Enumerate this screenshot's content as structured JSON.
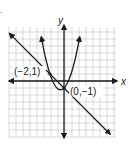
{
  "figure": {
    "type": "coordinate-graph",
    "axes": {
      "x_label": "x",
      "y_label": "y"
    },
    "grid": {
      "x_min": -8,
      "x_max": 7,
      "y_min": -8,
      "y_max": 8,
      "on": true
    },
    "curves": [
      {
        "name": "parabola",
        "equation": "y = x^2 + x - 1",
        "color": "#1a1a1a"
      },
      {
        "name": "line",
        "equation": "y = -x - 1",
        "color": "#1a1a1a"
      }
    ],
    "points": [
      {
        "label": "(−2,1)",
        "x": -2,
        "y": 1
      },
      {
        "label": "(0,−1)",
        "x": 0,
        "y": -1
      }
    ],
    "marker": "."
  },
  "chart_data": {
    "type": "line",
    "title": "",
    "xlabel": "x",
    "ylabel": "y",
    "grid": true,
    "series": [
      {
        "name": "y = x^2 + x - 1",
        "x": [
          -3,
          -2,
          -1,
          -0.5,
          0,
          1,
          2
        ],
        "values": [
          5,
          1,
          -1,
          -1.25,
          -1,
          1,
          5
        ]
      },
      {
        "name": "y = -x - 1",
        "x": [
          -8,
          -2,
          0,
          7
        ],
        "values": [
          7,
          1,
          -1,
          -8
        ]
      }
    ],
    "annotations": [
      "(−2,1)",
      "(0,−1)"
    ]
  }
}
